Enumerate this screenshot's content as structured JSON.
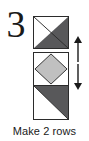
{
  "step": {
    "number": "3"
  },
  "caption": {
    "text": "Make 2 rows"
  },
  "colors": {
    "dark_fabric": "#58585a",
    "light_fabric": "#c0c0c0",
    "background_fabric": "#ffffff",
    "outline": "#2b2b2b",
    "text": "#1a1a1a"
  },
  "diagram": {
    "type": "quilt-block-assembly",
    "blocks": [
      {
        "name": "half-square-triangle-top",
        "description": "Square divided corner to corner: white upper-left triangle, dark gray lower-right triangle",
        "fills": [
          "#ffffff",
          "#58585a"
        ]
      },
      {
        "name": "square-in-a-square",
        "description": "Light gray diamond on point inside a white square with white corner triangles",
        "fills": [
          "#ffffff",
          "#c0c0c0"
        ]
      },
      {
        "name": "half-square-triangle-bottom",
        "description": "Square divided corner to corner: dark gray upper-right triangle, white lower-left triangle",
        "fills": [
          "#58585a",
          "#ffffff"
        ]
      }
    ],
    "arrows": [
      {
        "name": "arrow-up",
        "direction": "up"
      },
      {
        "name": "arrow-down",
        "direction": "down"
      }
    ]
  }
}
